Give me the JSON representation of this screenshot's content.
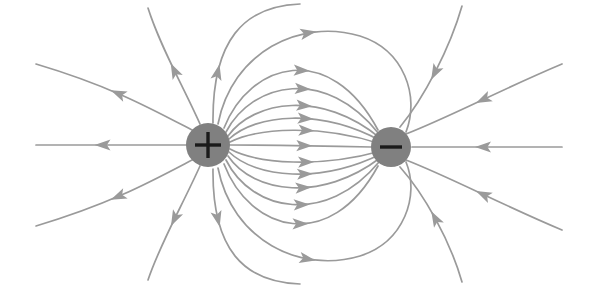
{
  "figure": {
    "background_color": "#ffffff",
    "width": 597,
    "height": 285
  },
  "style": {
    "field_line_color": "#9a9a9a",
    "field_line_width": 1.7,
    "arrow_color": "#9a9a9a",
    "charge_fill_color": "#808080",
    "charge_sign_color": "#1a1a1a",
    "charge_sign_stroke_width": 3.4
  },
  "charges": [
    {
      "name": "positive-charge",
      "sign": "+",
      "label": "+",
      "polarity": "positive",
      "cx": 208,
      "cy": 145,
      "r": 22,
      "fill": "#808080",
      "sign_color": "#1a1a1a",
      "sign_arm_length": 13
    },
    {
      "name": "negative-charge",
      "sign": "−",
      "label": "−",
      "polarity": "negative",
      "cx": 391,
      "cy": 147,
      "r": 20,
      "fill": "#808080",
      "sign_color": "#1a1a1a",
      "sign_arm_length": 11
    }
  ],
  "field_lines": {
    "description": "Field lines emanate radially from the positive charge and converge radially into the negative charge. Inner lines arc directly between the two charges; outer lines sweep out to the edges of the frame.",
    "direction_convention": "Arrowheads point away from the positive charge and toward the negative charge.",
    "inner_arcs": [
      {
        "name": "inner-arc-up-5",
        "d": "M 224 128 C 250 62, 330 40, 378 130",
        "arrow_t": 0.5,
        "bulge": "up"
      },
      {
        "name": "inner-arc-up-4",
        "d": "M 226 132 C 252 82, 326 66, 379 134",
        "arrow_t": 0.5,
        "bulge": "up"
      },
      {
        "name": "inner-arc-up-3",
        "d": "M 228 136 C 254 100, 322 90, 380 138",
        "arrow_t": 0.5,
        "bulge": "up"
      },
      {
        "name": "inner-arc-up-2",
        "d": "M 229 139 C 256 114, 320 108, 381 141",
        "arrow_t": 0.5,
        "bulge": "up"
      },
      {
        "name": "inner-arc-up-1",
        "d": "M 230 142 C 258 128, 320 124, 381 144",
        "arrow_t": 0.5,
        "bulge": "up"
      },
      {
        "name": "inner-line-axis",
        "d": "M 230 145 C 268 145, 330 146, 371 147",
        "arrow_t": 0.52,
        "bulge": "none"
      },
      {
        "name": "inner-arc-dn-1",
        "d": "M 230 149 C 258 164, 320 168, 381 151",
        "arrow_t": 0.5,
        "bulge": "down"
      },
      {
        "name": "inner-arc-dn-2",
        "d": "M 229 152 C 256 178, 320 184, 381 154",
        "arrow_t": 0.5,
        "bulge": "down"
      },
      {
        "name": "inner-arc-dn-3",
        "d": "M 228 156 C 254 194, 322 202, 380 158",
        "arrow_t": 0.5,
        "bulge": "down"
      },
      {
        "name": "inner-arc-dn-4",
        "d": "M 226 160 C 252 212, 326 226, 379 162",
        "arrow_t": 0.5,
        "bulge": "down"
      },
      {
        "name": "inner-arc-dn-5",
        "d": "M 224 164 C 250 232, 330 254, 378 166",
        "arrow_t": 0.5,
        "bulge": "down"
      }
    ],
    "outer_arcs": [
      {
        "name": "outer-arc-top-1",
        "d": "M 218 124 C 232 52, 300 18, 360 36 C 404 50, 420 96, 406 132",
        "arrow_t": 0.44,
        "bulge": "up"
      },
      {
        "name": "outer-arc-top-2",
        "d": "M 213 123 C 212 40, 244 6, 300 4",
        "arrow_t": 0.3,
        "bulge": "up"
      },
      {
        "name": "outer-arc-bot-1",
        "d": "M 218 168 C 232 240, 300 274, 360 256 C 404 242, 420 196, 406 162",
        "arrow_t": 0.44,
        "bulge": "down"
      },
      {
        "name": "outer-arc-bot-2",
        "d": "M 213 169 C 212 250, 244 282, 300 284",
        "arrow_t": 0.3,
        "bulge": "down"
      }
    ],
    "outward_from_positive": [
      {
        "name": "outgoing-left-horizontal",
        "d": "M 186 145 L 36 145",
        "arrow_t": 0.55,
        "direction": "left"
      },
      {
        "name": "outgoing-upper-left-1",
        "d": "M 192 130 C 150 108, 110 86, 36 64",
        "arrow_t": 0.48,
        "direction": "up-left"
      },
      {
        "name": "outgoing-lower-left-1",
        "d": "M 192 160 C 150 182, 110 204, 36 226",
        "arrow_t": 0.48,
        "direction": "down-left"
      },
      {
        "name": "outgoing-up-1",
        "d": "M 200 124 C 182 84, 160 46, 148 8",
        "arrow_t": 0.46,
        "direction": "up"
      },
      {
        "name": "outgoing-down-1",
        "d": "M 200 166 C 182 206, 160 244, 148 280",
        "arrow_t": 0.46,
        "direction": "down"
      }
    ],
    "inward_to_negative": [
      {
        "name": "incoming-right-horizontal",
        "d": "M 562 147 L 412 147",
        "arrow_t": 0.52,
        "direction": "left"
      },
      {
        "name": "incoming-upper-right-1",
        "d": "M 562 64 C 500 90, 452 116, 406 134",
        "arrow_t": 0.5,
        "direction": "down-left"
      },
      {
        "name": "incoming-lower-right-1",
        "d": "M 562 230 C 500 204, 452 178, 406 160",
        "arrow_t": 0.5,
        "direction": "up-left"
      },
      {
        "name": "incoming-up-right-1",
        "d": "M 462 6 C 450 48, 424 98, 400 127",
        "arrow_t": 0.52,
        "direction": "down"
      },
      {
        "name": "incoming-down-right-1",
        "d": "M 462 282 C 450 240, 424 194, 400 167",
        "arrow_t": 0.52,
        "direction": "up"
      }
    ]
  }
}
